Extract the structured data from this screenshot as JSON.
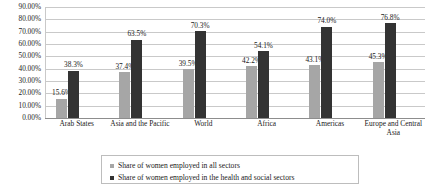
{
  "chart_data": {
    "type": "bar",
    "title": "",
    "xlabel": "",
    "ylabel": "",
    "ylim": [
      0,
      90
    ],
    "ytick_labels": [
      "0.00%",
      "10.00%",
      "20.00%",
      "30.00%",
      "40.00%",
      "50.00%",
      "60.00%",
      "70.00%",
      "80.00%",
      "90.00%"
    ],
    "ytick_values": [
      0,
      10,
      20,
      30,
      40,
      50,
      60,
      70,
      80,
      90
    ],
    "grid": true,
    "legend_position": "bottom",
    "categories": [
      "Arab States",
      "Asia and the Pacific",
      "World",
      "Africa",
      "Americas",
      "Europe and Central Asia"
    ],
    "series": [
      {
        "name": "Share of women employed in all sectors",
        "color": "#a6a6a6",
        "values": [
          15.6,
          37.4,
          39.5,
          42.2,
          43.1,
          45.3
        ],
        "value_labels": [
          "15.6%",
          "37.4%",
          "39.5%",
          "42.2%",
          "43.1%",
          "45.3%"
        ]
      },
      {
        "name": "Share of women employed in the health and social sectors",
        "color": "#333333",
        "values": [
          38.3,
          63.5,
          70.3,
          54.1,
          74.0,
          76.8
        ],
        "value_labels": [
          "38.3%",
          "63.5%",
          "70.3%",
          "54.1%",
          "74.0%",
          "76.8%"
        ]
      }
    ]
  },
  "legend": {
    "items": [
      {
        "label": "Share of women employed in all sectors",
        "marker": "light-gray-square"
      },
      {
        "label": "Share of women employed in the health and social sectors",
        "marker": "dark-square"
      }
    ]
  }
}
